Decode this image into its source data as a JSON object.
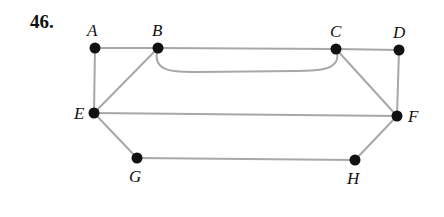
{
  "problem_number": "46.",
  "edge_color": "#a8a8a8",
  "vertex_color": "#111111",
  "vertices": [
    {
      "id": "A",
      "x": 95,
      "y": 48,
      "lx": 87,
      "ly": 36
    },
    {
      "id": "B",
      "x": 158,
      "y": 48,
      "lx": 152,
      "ly": 36
    },
    {
      "id": "C",
      "x": 336,
      "y": 49,
      "lx": 330,
      "ly": 37
    },
    {
      "id": "D",
      "x": 399,
      "y": 50,
      "lx": 393,
      "ly": 38
    },
    {
      "id": "E",
      "x": 94,
      "y": 113,
      "lx": 74,
      "ly": 119
    },
    {
      "id": "F",
      "x": 397,
      "y": 116,
      "lx": 408,
      "ly": 122
    },
    {
      "id": "G",
      "x": 137,
      "y": 158,
      "lx": 129,
      "ly": 182
    },
    {
      "id": "H",
      "x": 355,
      "y": 160,
      "lx": 347,
      "ly": 184
    }
  ],
  "edges": [
    [
      "A",
      "B"
    ],
    [
      "B",
      "C"
    ],
    [
      "C",
      "D"
    ],
    [
      "A",
      "E"
    ],
    [
      "B",
      "E"
    ],
    [
      "C",
      "F"
    ],
    [
      "D",
      "F"
    ],
    [
      "E",
      "F"
    ],
    [
      "E",
      "G"
    ],
    [
      "G",
      "H"
    ],
    [
      "H",
      "F"
    ]
  ],
  "curved_edges": [
    [
      "B",
      "C"
    ]
  ]
}
